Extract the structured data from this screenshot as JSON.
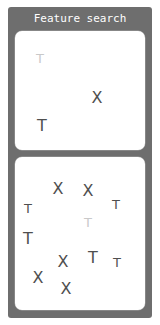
{
  "window": {
    "title": "Feature search",
    "background_color": "#6e6e6e",
    "title_color": "#ffffff",
    "page_background": "#ffffff"
  },
  "colors": {
    "distractor": "#4f4f4f",
    "target": "#c9c9c9",
    "panel": "#ffffff"
  },
  "panels": {
    "target_panel": {
      "name": "target-panel",
      "items": [
        {
          "char": "T",
          "color": "light",
          "size": "small",
          "x": 40,
          "y": 58
        },
        {
          "char": "X",
          "color": "dark",
          "size": "big",
          "x": 97,
          "y": 98
        },
        {
          "char": "T",
          "color": "dark",
          "size": "big",
          "x": 42,
          "y": 126
        }
      ]
    },
    "search_panel": {
      "name": "search-panel",
      "items": [
        {
          "char": "X",
          "color": "dark",
          "size": "big",
          "x": 58,
          "y": 189
        },
        {
          "char": "X",
          "color": "dark",
          "size": "big",
          "x": 88,
          "y": 191
        },
        {
          "char": "T",
          "color": "dark",
          "size": "small",
          "x": 28,
          "y": 208
        },
        {
          "char": "T",
          "color": "dark",
          "size": "small",
          "x": 116,
          "y": 204
        },
        {
          "char": "T",
          "color": "light",
          "size": "small",
          "x": 88,
          "y": 222
        },
        {
          "char": "T",
          "color": "dark",
          "size": "big",
          "x": 28,
          "y": 239
        },
        {
          "char": "X",
          "color": "dark",
          "size": "big",
          "x": 63,
          "y": 262
        },
        {
          "char": "T",
          "color": "dark",
          "size": "big",
          "x": 93,
          "y": 258
        },
        {
          "char": "T",
          "color": "dark",
          "size": "small",
          "x": 117,
          "y": 262
        },
        {
          "char": "X",
          "color": "dark",
          "size": "big",
          "x": 38,
          "y": 278
        },
        {
          "char": "X",
          "color": "dark",
          "size": "big",
          "x": 66,
          "y": 289
        }
      ]
    }
  }
}
